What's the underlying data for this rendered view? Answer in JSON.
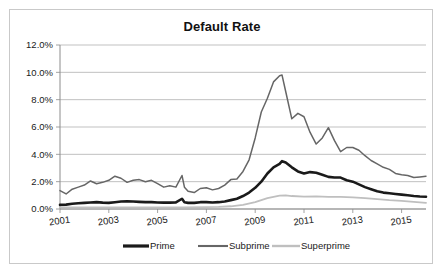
{
  "chart_data": {
    "type": "line",
    "title": "Default Rate",
    "xlabel": "",
    "ylabel": "",
    "ylim": [
      0,
      12
    ],
    "xlim": [
      2001,
      2016
    ],
    "grid": true,
    "legend_position": "bottom",
    "y_ticks": [
      "0.0%",
      "2.0%",
      "4.0%",
      "6.0%",
      "8.0%",
      "10.0%",
      "12.0%"
    ],
    "y_tick_values": [
      0,
      2,
      4,
      6,
      8,
      10,
      12
    ],
    "x_ticks": [
      "2001",
      "2003",
      "2005",
      "2007",
      "2009",
      "2011",
      "2013",
      "2015"
    ],
    "x_tick_values": [
      2001,
      2003,
      2005,
      2007,
      2009,
      2011,
      2013,
      2015
    ],
    "series": [
      {
        "name": "Prime",
        "color": "#1a1a1a",
        "width": 2.6,
        "x": [
          2001.0,
          2001.25,
          2001.5,
          2001.75,
          2002.0,
          2002.25,
          2002.5,
          2002.75,
          2003.0,
          2003.25,
          2003.5,
          2003.75,
          2004.0,
          2004.25,
          2004.5,
          2004.75,
          2005.0,
          2005.25,
          2005.5,
          2005.75,
          2006.0,
          2006.1,
          2006.25,
          2006.5,
          2006.75,
          2007.0,
          2007.25,
          2007.5,
          2007.75,
          2008.0,
          2008.25,
          2008.5,
          2008.75,
          2009.0,
          2009.25,
          2009.5,
          2009.75,
          2010.0,
          2010.1,
          2010.25,
          2010.5,
          2010.75,
          2011.0,
          2011.25,
          2011.5,
          2011.75,
          2012.0,
          2012.25,
          2012.5,
          2012.75,
          2013.0,
          2013.25,
          2013.5,
          2013.75,
          2014.0,
          2014.25,
          2014.5,
          2014.75,
          2015.0,
          2015.25,
          2015.5,
          2015.75,
          2016.0
        ],
        "values": [
          0.3,
          0.32,
          0.38,
          0.42,
          0.45,
          0.48,
          0.5,
          0.47,
          0.45,
          0.5,
          0.55,
          0.57,
          0.55,
          0.52,
          0.5,
          0.5,
          0.48,
          0.47,
          0.47,
          0.48,
          0.75,
          0.5,
          0.45,
          0.45,
          0.5,
          0.5,
          0.48,
          0.5,
          0.55,
          0.65,
          0.75,
          0.95,
          1.2,
          1.55,
          2.0,
          2.6,
          3.05,
          3.3,
          3.5,
          3.4,
          3.05,
          2.75,
          2.6,
          2.7,
          2.65,
          2.5,
          2.35,
          2.3,
          2.3,
          2.1,
          2.0,
          1.8,
          1.6,
          1.45,
          1.3,
          1.2,
          1.15,
          1.1,
          1.05,
          1.0,
          0.95,
          0.92,
          0.9
        ]
      },
      {
        "name": "Subprime",
        "color": "#666666",
        "width": 1.5,
        "x": [
          2001.0,
          2001.25,
          2001.5,
          2001.75,
          2002.0,
          2002.25,
          2002.5,
          2002.75,
          2003.0,
          2003.25,
          2003.5,
          2003.75,
          2004.0,
          2004.25,
          2004.5,
          2004.75,
          2005.0,
          2005.25,
          2005.5,
          2005.75,
          2006.0,
          2006.1,
          2006.25,
          2006.5,
          2006.75,
          2007.0,
          2007.25,
          2007.5,
          2007.75,
          2008.0,
          2008.25,
          2008.5,
          2008.75,
          2009.0,
          2009.25,
          2009.5,
          2009.75,
          2010.0,
          2010.1,
          2010.25,
          2010.5,
          2010.75,
          2011.0,
          2011.25,
          2011.5,
          2011.75,
          2012.0,
          2012.25,
          2012.5,
          2012.75,
          2013.0,
          2013.25,
          2013.5,
          2013.75,
          2014.0,
          2014.25,
          2014.5,
          2014.75,
          2015.0,
          2015.25,
          2015.5,
          2015.75,
          2016.0
        ],
        "values": [
          1.35,
          1.1,
          1.45,
          1.6,
          1.75,
          2.05,
          1.85,
          1.95,
          2.1,
          2.4,
          2.25,
          1.95,
          2.1,
          2.15,
          2.0,
          2.1,
          1.85,
          1.6,
          1.7,
          1.6,
          2.45,
          1.6,
          1.3,
          1.2,
          1.5,
          1.55,
          1.4,
          1.5,
          1.75,
          2.15,
          2.2,
          2.75,
          3.6,
          5.2,
          7.1,
          8.1,
          9.3,
          9.75,
          9.8,
          8.6,
          6.6,
          7.0,
          6.75,
          5.6,
          4.75,
          5.2,
          5.95,
          5.0,
          4.2,
          4.5,
          4.5,
          4.3,
          3.9,
          3.55,
          3.3,
          3.05,
          2.9,
          2.6,
          2.5,
          2.45,
          2.3,
          2.35,
          2.4
        ]
      },
      {
        "name": "Superprime",
        "color": "#bfbfbf",
        "width": 1.8,
        "x": [
          2001.0,
          2002.0,
          2003.0,
          2004.0,
          2005.0,
          2006.0,
          2007.0,
          2007.5,
          2008.0,
          2008.5,
          2009.0,
          2009.5,
          2010.0,
          2010.25,
          2010.5,
          2011.0,
          2011.5,
          2012.0,
          2012.5,
          2013.0,
          2013.5,
          2014.0,
          2014.5,
          2015.0,
          2015.5,
          2016.0
        ],
        "values": [
          0.12,
          0.12,
          0.12,
          0.12,
          0.12,
          0.12,
          0.13,
          0.15,
          0.2,
          0.3,
          0.5,
          0.8,
          0.98,
          1.0,
          0.95,
          0.9,
          0.92,
          0.88,
          0.88,
          0.85,
          0.8,
          0.72,
          0.65,
          0.6,
          0.52,
          0.45
        ]
      }
    ]
  },
  "legend": {
    "items": [
      {
        "label": "Prime"
      },
      {
        "label": "Subprime"
      },
      {
        "label": "Superprime"
      }
    ]
  }
}
